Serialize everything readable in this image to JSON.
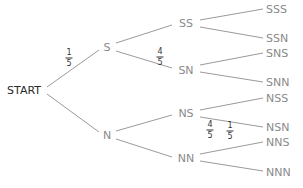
{
  "diagram": {
    "type": "probability-tree",
    "root": "START",
    "level1": [
      "S",
      "N"
    ],
    "level2": [
      "SS",
      "SN",
      "NS",
      "NN"
    ],
    "level3": [
      "SSS",
      "SSN",
      "SNS",
      "SNN",
      "NSS",
      "NSN",
      "NNS",
      "NNN"
    ],
    "fractions": [
      {
        "num": "1",
        "den": "5",
        "edge": "START-S"
      },
      {
        "num": "4",
        "den": "5",
        "edge": "S-SN"
      },
      {
        "num": "4",
        "den": "5",
        "edge": "NS-NSN"
      },
      {
        "num": "1",
        "den": "5",
        "edge": "NN-NNS"
      }
    ],
    "colors": {
      "line": "#9a9a9a",
      "node_text": "#8a8a8a",
      "start_text": "#2a2a2a",
      "fraction_text": "#333333"
    }
  }
}
